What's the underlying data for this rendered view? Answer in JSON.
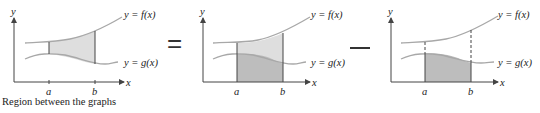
{
  "diagram": {
    "caption": "Region between the graphs",
    "equals_sign": "=",
    "minus_sign": "−",
    "colors": {
      "curve": "#a8a8a8",
      "axis": "#444444",
      "light_fill": "#dedede",
      "dark_fill": "#bdbdbd",
      "text": "#222222"
    },
    "panels": [
      {
        "id": "region-between",
        "y_axis_label": "y",
        "x_axis_label": "x",
        "tick_a": "a",
        "tick_b": "b",
        "f_label": "y = f(x)",
        "g_label": "y = g(x)",
        "shading": "between f and g from a to b"
      },
      {
        "id": "area-under-f",
        "y_axis_label": "y",
        "x_axis_label": "x",
        "tick_a": "a",
        "tick_b": "b",
        "f_label": "y = f(x)",
        "g_label": "y = g(x)",
        "shading": "under f from a to b (under g darker)"
      },
      {
        "id": "area-under-g",
        "y_axis_label": "y",
        "x_axis_label": "x",
        "tick_a": "a",
        "tick_b": "b",
        "f_label": "y = f(x)",
        "g_label": "y = g(x)",
        "shading": "under g from a to b"
      }
    ]
  }
}
